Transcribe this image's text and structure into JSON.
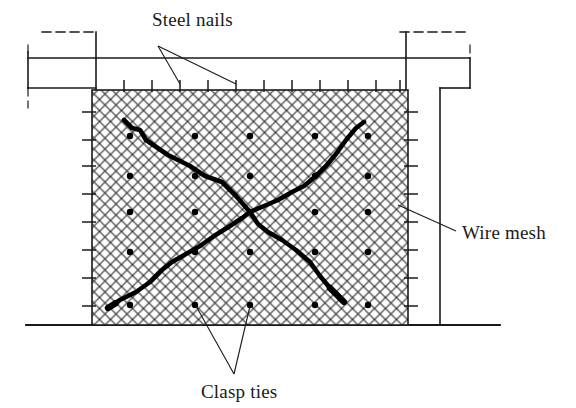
{
  "figure": {
    "background_color": "#ffffff",
    "line_color": "#1a1a1a",
    "mesh_color": "#2b2b2b",
    "crack_color": "#000000",
    "tie_color": "#000000"
  },
  "labels": {
    "steel_nails": "Steel nails",
    "wire_mesh": "Wire mesh",
    "clasp_ties": "Clasp ties"
  },
  "label_positions": {
    "steel_nails": {
      "x": 152,
      "y": 26
    },
    "wire_mesh": {
      "x": 462,
      "y": 233
    },
    "clasp_ties": {
      "x": 201,
      "y": 392
    }
  },
  "frame": {
    "description": "Reinforced concrete frame outline: columns at left and right, beam across the top, ground line at the bottom.",
    "outer_left_column_x": 28,
    "inner_left_column_x": 56,
    "inner_right_column_x": 440,
    "outer_right_column_x": 470,
    "beam_top_y": 32,
    "beam_bottom_y": 60,
    "corbel_y": 88,
    "ground_line_y": 325,
    "ground_line_x1": 26,
    "ground_line_x2": 500
  },
  "panel": {
    "description": "Wire-mesh covered infill panel",
    "left": 92,
    "top": 90,
    "right": 408,
    "bottom": 325,
    "width": 316,
    "height": 235,
    "mesh_cell_size": 11,
    "mesh_stroke_width": 1.1
  },
  "steel_nails": {
    "count_top": 11,
    "count_left": 8,
    "count_right": 8,
    "nail_length": 10,
    "top_y_outer": 80,
    "top_xs": [
      124,
      152,
      180,
      208,
      236,
      264,
      292,
      320,
      348,
      376,
      400
    ],
    "side_ys": [
      112,
      140,
      166,
      194,
      222,
      250,
      278,
      306
    ],
    "left_x_outer": 82,
    "right_x_outer": 418
  },
  "clasp_ties": {
    "rows": 5,
    "cols": 5,
    "radius": 3.2,
    "xs": [
      130,
      195,
      250,
      315,
      368
    ],
    "ys": [
      136,
      176,
      212,
      252,
      305
    ]
  },
  "cracks": {
    "description": "Two thick diagonal shear cracks crossing near the panel centre",
    "crossing_point": {
      "x": 250,
      "y": 212
    },
    "crack_1": {
      "name": "upper-left-to-lower-right-crack",
      "points": [
        [
          124,
          120
        ],
        [
          132,
          128
        ],
        [
          140,
          130
        ],
        [
          146,
          140
        ],
        [
          168,
          155
        ],
        [
          190,
          166
        ],
        [
          205,
          176
        ],
        [
          222,
          182
        ],
        [
          236,
          196
        ],
        [
          250,
          212
        ],
        [
          258,
          224
        ],
        [
          268,
          232
        ],
        [
          282,
          240
        ],
        [
          296,
          250
        ],
        [
          310,
          262
        ],
        [
          320,
          276
        ],
        [
          330,
          288
        ],
        [
          338,
          296
        ],
        [
          344,
          302
        ]
      ],
      "stroke_width": 4.6
    },
    "crack_2": {
      "name": "lower-left-to-upper-right-crack",
      "points": [
        [
          108,
          308
        ],
        [
          120,
          300
        ],
        [
          136,
          292
        ],
        [
          150,
          282
        ],
        [
          162,
          270
        ],
        [
          172,
          262
        ],
        [
          186,
          254
        ],
        [
          200,
          246
        ],
        [
          214,
          236
        ],
        [
          230,
          226
        ],
        [
          242,
          218
        ],
        [
          250,
          212
        ],
        [
          264,
          206
        ],
        [
          278,
          200
        ],
        [
          292,
          192
        ],
        [
          304,
          186
        ],
        [
          316,
          176
        ],
        [
          326,
          166
        ],
        [
          336,
          154
        ],
        [
          346,
          140
        ],
        [
          356,
          128
        ],
        [
          364,
          122
        ]
      ],
      "stroke_width": 4.6
    }
  },
  "leaders": {
    "steel_nails": [
      {
        "name": "leader-to-top-nail-a",
        "from": [
          158,
          46
        ],
        "to": [
          180,
          84
        ]
      },
      {
        "name": "leader-to-top-nail-b",
        "from": [
          158,
          46
        ],
        "to": [
          236,
          84
        ]
      }
    ],
    "wire_mesh": [
      {
        "name": "leader-to-mesh",
        "from": [
          456,
          231
        ],
        "to": [
          398,
          205
        ]
      }
    ],
    "clasp_ties": [
      {
        "name": "leader-to-tie-a",
        "from": [
          234,
          374
        ],
        "to": [
          196,
          306
        ]
      },
      {
        "name": "leader-to-tie-b",
        "from": [
          234,
          374
        ],
        "to": [
          250,
          306
        ]
      }
    ]
  }
}
